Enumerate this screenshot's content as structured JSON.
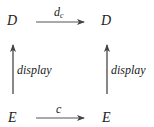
{
  "diagram": {
    "type": "commutative-square",
    "nodes": {
      "top_left": "D",
      "top_right": "D",
      "bottom_left": "E",
      "bottom_right": "E"
    },
    "arrows": {
      "top": {
        "from": "top_left",
        "to": "top_right",
        "label_main": "d",
        "label_sub": "c"
      },
      "bottom": {
        "from": "bottom_left",
        "to": "bottom_right",
        "label": "c"
      },
      "left": {
        "from": "bottom_left",
        "to": "top_left",
        "label": "display"
      },
      "right": {
        "from": "bottom_right",
        "to": "top_right",
        "label": "display"
      }
    },
    "colors": {
      "arrow": "#555555",
      "text": "#222222"
    }
  }
}
